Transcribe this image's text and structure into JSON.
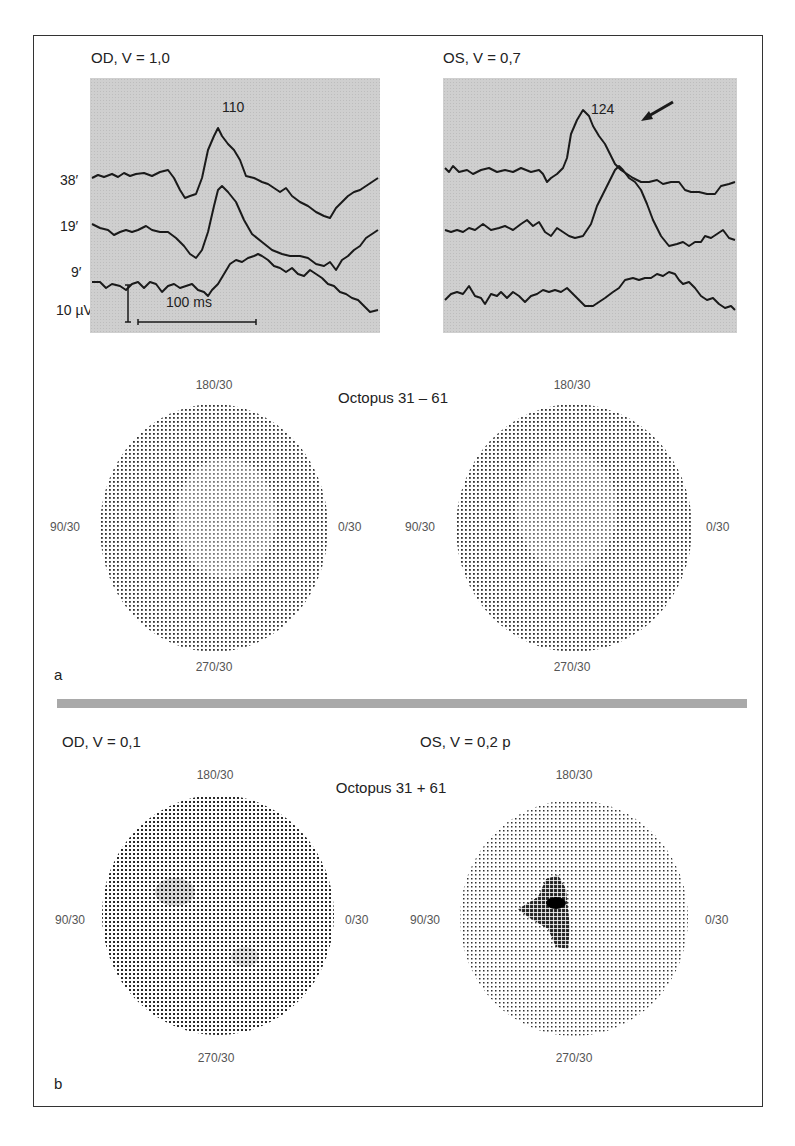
{
  "figure": {
    "section_a": {
      "label": "a",
      "vep": {
        "left": {
          "title": "OD, V = 1,0",
          "peak_latency": "110"
        },
        "right": {
          "title": "OS, V = 0,7",
          "peak_latency": "124",
          "arrow": "arrow-pointing-to-peak"
        },
        "row_labels": [
          "38′",
          "19′",
          "9′"
        ],
        "scale_voltage": "10 µV",
        "scale_time": "100 ms"
      },
      "perimetry_title": "Octopus 31 – 61",
      "perimetry": {
        "left": {
          "top": "180/30",
          "left": "90/30",
          "right": "0/30",
          "bottom": "270/30"
        },
        "right": {
          "top": "180/30",
          "left": "90/30",
          "right": "0/30",
          "bottom": "270/30"
        }
      }
    },
    "section_b": {
      "label": "b",
      "left_title": "OD, V = 0,1",
      "right_title": "OS, V = 0,2 p",
      "perimetry_title": "Octopus 31 + 61",
      "perimetry": {
        "left": {
          "top": "180/30",
          "left": "90/30",
          "right": "0/30",
          "bottom": "270/30"
        },
        "right": {
          "top": "180/30",
          "left": "90/30",
          "right": "0/30",
          "bottom": "270/30"
        }
      }
    },
    "colors": {
      "panel_bg": "#cfcfcf",
      "trace": "#1a1a1a",
      "separator": "#a9a9a9",
      "dots": "#333333"
    }
  }
}
